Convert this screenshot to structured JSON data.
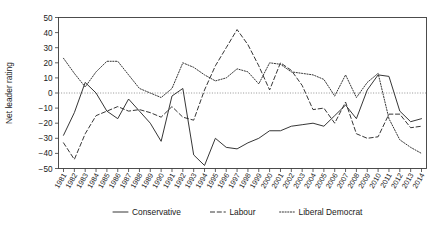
{
  "chart_data": {
    "type": "line",
    "title": "",
    "xlabel": "",
    "ylabel": "Net leader rating",
    "ylim": [
      -50,
      50
    ],
    "yticks": [
      50,
      40,
      30,
      20,
      10,
      0,
      -10,
      -20,
      -30,
      -40,
      -50
    ],
    "ytick_labels": [
      "50",
      "40",
      "30",
      "20",
      "10",
      "0",
      "−10",
      "−20",
      "−30",
      "−40",
      "−50"
    ],
    "grid": false,
    "zero_reference_line": true,
    "legend_position": "bottom",
    "categories": [
      "1981",
      "1982",
      "1983",
      "1984",
      "1985",
      "1986",
      "1987",
      "1988",
      "1989",
      "1990",
      "1991",
      "1992",
      "1993",
      "1994",
      "1995",
      "1996",
      "1997",
      "1998",
      "1999",
      "2000",
      "2001",
      "2002",
      "2003",
      "2004",
      "2005",
      "2006",
      "2007",
      "2008",
      "2009",
      "2010",
      "2011",
      "2012",
      "2013",
      "2014"
    ],
    "series": [
      {
        "name": "Conservative",
        "style": "solid",
        "values": [
          -28,
          -13,
          7,
          0,
          -12,
          -17,
          -4,
          -12,
          -20,
          -32,
          -2,
          3,
          -41,
          -48,
          -30,
          -36,
          -37,
          -33,
          -30,
          -25,
          -25,
          -22,
          -21,
          -20,
          -22,
          -15,
          -8,
          -17,
          2,
          12,
          11,
          -12,
          -19,
          -17
        ]
      },
      {
        "name": "Labour",
        "style": "dashed",
        "values": [
          -33,
          -44,
          -27,
          -15,
          -12,
          -9,
          -12,
          -11,
          -13,
          -16,
          -9,
          -16,
          -18,
          2,
          18,
          30,
          42,
          32,
          18,
          2,
          20,
          15,
          5,
          -11,
          -10,
          -20,
          -6,
          -27,
          -30,
          -29,
          -14,
          -14,
          -23,
          -22
        ]
      },
      {
        "name": "Liberal Democrat",
        "style": "dotted",
        "values": [
          23,
          13,
          4,
          14,
          21,
          21,
          12,
          3,
          0,
          -3,
          3,
          20,
          17,
          12,
          8,
          10,
          16,
          14,
          6,
          20,
          19,
          14,
          13,
          12,
          9,
          -2,
          12,
          -3,
          7,
          13,
          -17,
          -31,
          -36,
          -40
        ]
      }
    ]
  },
  "legend": {
    "items": [
      {
        "label": "Conservative",
        "style": "solid"
      },
      {
        "label": "Labour",
        "style": "dashed"
      },
      {
        "label": "Liberal Democrat",
        "style": "dotted"
      }
    ]
  }
}
